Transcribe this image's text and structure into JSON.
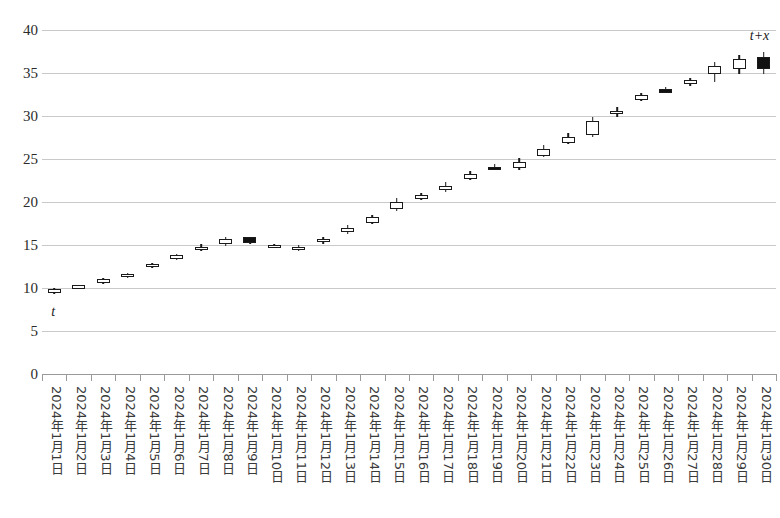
{
  "chart_data": {
    "type": "candlestick",
    "title": "",
    "xlabel": "",
    "ylabel": "",
    "ylim": [
      0,
      40
    ],
    "ytick_step": 5,
    "yticks": [
      0,
      5,
      10,
      15,
      20,
      25,
      30,
      35,
      40
    ],
    "grid": true,
    "legend": null,
    "categories": [
      "2024年1月1日",
      "2024年1月2日",
      "2024年1月3日",
      "2024年1月4日",
      "2024年1月5日",
      "2024年1月6日",
      "2024年1月7日",
      "2024年1月8日",
      "2024年1月9日",
      "2024年1月10日",
      "2024年1月11日",
      "2024年1月12日",
      "2024年1月13日",
      "2024年1月14日",
      "2024年1月15日",
      "2024年1月16日",
      "2024年1月17日",
      "2024年1月18日",
      "2024年1月19日",
      "2024年1月20日",
      "2024年1月21日",
      "2024年1月22日",
      "2024年1月23日",
      "2024年1月24日",
      "2024年1月25日",
      "2024年1月26日",
      "2024年1月27日",
      "2024年1月28日",
      "2024年1月29日",
      "2024年1月30日"
    ],
    "series": [
      {
        "name": "price",
        "fields": [
          "open",
          "high",
          "low",
          "close",
          "direction"
        ],
        "values": [
          [
            9.9,
            10.0,
            9.3,
            9.4,
            "up"
          ],
          [
            10.1,
            10.4,
            10.0,
            10.3,
            "up"
          ],
          [
            10.7,
            11.2,
            10.5,
            11.0,
            "up"
          ],
          [
            11.4,
            11.7,
            11.2,
            11.6,
            "up"
          ],
          [
            12.5,
            12.9,
            12.3,
            12.8,
            "up"
          ],
          [
            13.5,
            13.9,
            13.3,
            13.8,
            "up"
          ],
          [
            14.4,
            15.1,
            14.3,
            14.8,
            "up"
          ],
          [
            15.1,
            15.9,
            14.9,
            15.7,
            "up"
          ],
          [
            15.9,
            15.9,
            15.1,
            15.2,
            "down"
          ],
          [
            14.9,
            15.1,
            14.8,
            15.0,
            "up"
          ],
          [
            14.5,
            15.0,
            14.3,
            14.8,
            "up"
          ],
          [
            15.3,
            15.9,
            15.1,
            15.7,
            "up"
          ],
          [
            16.5,
            17.3,
            16.3,
            17.0,
            "up"
          ],
          [
            17.6,
            18.5,
            17.4,
            18.2,
            "up"
          ],
          [
            19.2,
            20.5,
            19.0,
            20.0,
            "up"
          ],
          [
            20.4,
            21.1,
            20.2,
            20.8,
            "up"
          ],
          [
            21.4,
            22.3,
            21.2,
            21.9,
            "up"
          ],
          [
            22.7,
            23.6,
            22.5,
            23.3,
            "up"
          ],
          [
            24.1,
            24.4,
            23.7,
            23.9,
            "down"
          ],
          [
            23.9,
            25.1,
            23.7,
            24.6,
            "up"
          ],
          [
            25.4,
            26.6,
            25.2,
            26.2,
            "up"
          ],
          [
            26.9,
            28.0,
            26.7,
            27.6,
            "up"
          ],
          [
            27.8,
            29.9,
            27.6,
            29.4,
            "up"
          ],
          [
            30.5,
            31.0,
            29.9,
            30.6,
            "up"
          ],
          [
            31.9,
            32.7,
            31.7,
            32.5,
            "up"
          ],
          [
            33.1,
            33.4,
            32.8,
            33.0,
            "down"
          ],
          [
            33.7,
            34.4,
            33.5,
            34.2,
            "up"
          ],
          [
            34.9,
            36.3,
            33.9,
            35.8,
            "up"
          ],
          [
            35.5,
            37.1,
            34.9,
            36.6,
            "up"
          ],
          [
            36.9,
            37.4,
            34.9,
            35.5,
            "down"
          ]
        ]
      }
    ],
    "annotations": [
      {
        "text": "t",
        "x_index": 0,
        "position": "below-first-candle"
      },
      {
        "text": "t+x",
        "x_index": 29,
        "position": "above-last-candle"
      }
    ],
    "colors": {
      "up_body_fill": "#ffffff",
      "down_body_fill": "#111111",
      "outline": "#1a1a1a",
      "gridline": "#c9c9c9",
      "axis": "#9a9a9a",
      "tick_text": "#2b2b2b"
    }
  }
}
